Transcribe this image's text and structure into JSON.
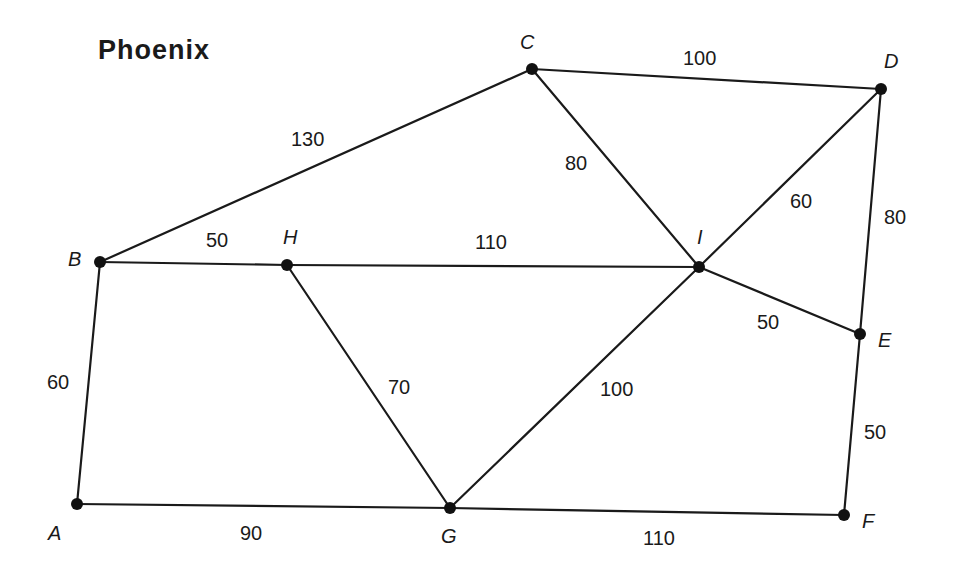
{
  "title": "Phoenix",
  "colors": {
    "ink": "#1a1a1a",
    "background": "#ffffff"
  },
  "nodes": [
    {
      "id": "A",
      "label": "A",
      "x": 77,
      "y": 504,
      "lx": 48,
      "ly": 540
    },
    {
      "id": "B",
      "label": "B",
      "x": 100,
      "y": 262,
      "lx": 68,
      "ly": 266
    },
    {
      "id": "C",
      "label": "C",
      "x": 532,
      "y": 69,
      "lx": 520,
      "ly": 49
    },
    {
      "id": "D",
      "label": "D",
      "x": 881,
      "y": 89,
      "lx": 884,
      "ly": 68
    },
    {
      "id": "E",
      "label": "E",
      "x": 860,
      "y": 334,
      "lx": 878,
      "ly": 347
    },
    {
      "id": "F",
      "label": "F",
      "x": 844,
      "y": 515,
      "lx": 862,
      "ly": 528
    },
    {
      "id": "G",
      "label": "G",
      "x": 450,
      "y": 508,
      "lx": 441,
      "ly": 543
    },
    {
      "id": "H",
      "label": "H",
      "x": 287,
      "y": 265,
      "lx": 283,
      "ly": 244
    },
    {
      "id": "I",
      "label": "I",
      "x": 699,
      "y": 267,
      "lx": 697,
      "ly": 244
    }
  ],
  "edges": [
    {
      "from": "B",
      "to": "C",
      "weight": "130",
      "lx": 291,
      "ly": 146
    },
    {
      "from": "C",
      "to": "D",
      "weight": "100",
      "lx": 683,
      "ly": 65
    },
    {
      "from": "C",
      "to": "I",
      "weight": "80",
      "lx": 565,
      "ly": 170
    },
    {
      "from": "D",
      "to": "I",
      "weight": "60",
      "lx": 790,
      "ly": 208
    },
    {
      "from": "D",
      "to": "E",
      "weight": "80",
      "lx": 884,
      "ly": 224
    },
    {
      "from": "B",
      "to": "H",
      "weight": "50",
      "lx": 206,
      "ly": 247
    },
    {
      "from": "H",
      "to": "I",
      "weight": "110",
      "lx": 475,
      "ly": 249
    },
    {
      "from": "I",
      "to": "E",
      "weight": "50",
      "lx": 757,
      "ly": 329
    },
    {
      "from": "B",
      "to": "A",
      "weight": "60",
      "lx": 47,
      "ly": 389
    },
    {
      "from": "H",
      "to": "G",
      "weight": "70",
      "lx": 388,
      "ly": 394
    },
    {
      "from": "I",
      "to": "G",
      "weight": "100",
      "lx": 600,
      "ly": 396
    },
    {
      "from": "E",
      "to": "F",
      "weight": "50",
      "lx": 864,
      "ly": 439
    },
    {
      "from": "A",
      "to": "G",
      "weight": "90",
      "lx": 240,
      "ly": 540
    },
    {
      "from": "G",
      "to": "F",
      "weight": "110",
      "lx": 643,
      "ly": 545
    }
  ]
}
